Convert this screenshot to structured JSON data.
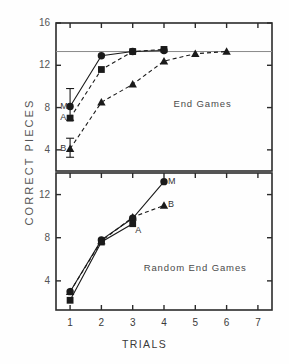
{
  "figure": {
    "axis_y_title": "CORRECT PIECES",
    "axis_x_title": "TRIALS"
  },
  "panels": {
    "top": {
      "note": "End Games",
      "ytick_labels": [
        "16",
        "12",
        "8",
        "4"
      ],
      "series_labels": {
        "m": "M",
        "a": "A",
        "b": "B"
      }
    },
    "bottom": {
      "note": "Random End Games",
      "ytick_labels": [
        "12",
        "8",
        "4"
      ],
      "series_labels": {
        "m": "M",
        "a": "A",
        "b": "B"
      }
    }
  },
  "xtick_labels": [
    "1",
    "2",
    "3",
    "4",
    "5",
    "6",
    "7"
  ],
  "colors": {
    "ink": "#1a1a1a",
    "axis": "#2b2b2b",
    "text": "#3a3a3a",
    "reference_line": "#8a8a8a",
    "background": "#fefefe"
  },
  "chart_data": {
    "type": "line",
    "title": "",
    "xlabel": "TRIALS",
    "ylabel": "CORRECT PIECES",
    "panels": [
      {
        "name": "End Games",
        "ylim": [
          2.0,
          16.0
        ],
        "yticks": [
          16,
          12,
          8,
          4
        ],
        "xlim": [
          0.55,
          7.45
        ],
        "xticks": [
          1,
          2,
          3,
          4,
          5,
          6,
          7
        ],
        "grid": false,
        "reference_line": {
          "y": 13.3,
          "style": "solid",
          "color": "#8a8a8a"
        },
        "series": [
          {
            "name": "M",
            "marker": "circle",
            "line": "solid",
            "x": [
              1,
              2,
              3,
              4
            ],
            "values": [
              8.1,
              12.9,
              13.3,
              13.4
            ],
            "error_bars": [
              {
                "x": 1,
                "low": 6.8,
                "high": 9.8
              }
            ]
          },
          {
            "name": "A",
            "marker": "square",
            "line": "dashed",
            "x": [
              1,
              2,
              3,
              4
            ],
            "values": [
              7.0,
              11.6,
              13.3,
              13.5
            ],
            "error_bars": []
          },
          {
            "name": "B",
            "marker": "triangle",
            "line": "dashed",
            "x": [
              1,
              2,
              3,
              4,
              5,
              6
            ],
            "values": [
              4.1,
              8.5,
              10.2,
              12.4,
              13.1,
              13.3
            ],
            "error_bars": [
              {
                "x": 1,
                "low": 3.3,
                "high": 5.1
              }
            ]
          }
        ],
        "annotations": [
          {
            "text": "End Games",
            "x": 4.3,
            "y": 8.3
          },
          {
            "text": "M",
            "x": 0.78,
            "y": 8.1
          },
          {
            "text": "A",
            "x": 0.78,
            "y": 7.0
          },
          {
            "text": "B",
            "x": 0.78,
            "y": 4.1
          }
        ]
      },
      {
        "name": "Random End Games",
        "ylim": [
          1.3,
          14.0
        ],
        "yticks": [
          12,
          8,
          4
        ],
        "xlim": [
          0.55,
          7.45
        ],
        "xticks": [
          1,
          2,
          3,
          4,
          5,
          6,
          7
        ],
        "grid": false,
        "series": [
          {
            "name": "M",
            "marker": "circle",
            "line": "solid",
            "x": [
              1,
              2,
              3,
              4
            ],
            "values": [
              3.0,
              7.8,
              9.8,
              13.2
            ],
            "error_bars": []
          },
          {
            "name": "A",
            "marker": "square",
            "line": "solid",
            "x": [
              1,
              2,
              3
            ],
            "values": [
              2.2,
              7.6,
              9.3
            ],
            "error_bars": []
          },
          {
            "name": "B",
            "marker": "triangle",
            "line": "dashed",
            "x": [
              1,
              2,
              3,
              4
            ],
            "values": [
              3.0,
              7.7,
              9.9,
              11.0
            ],
            "error_bars": []
          }
        ],
        "annotations": [
          {
            "text": "Random End Games",
            "x": 3.35,
            "y": 5.2
          },
          {
            "text": "M",
            "x": 4.22,
            "y": 13.2
          },
          {
            "text": "B",
            "x": 4.22,
            "y": 11.0
          },
          {
            "text": "A",
            "x": 3.18,
            "y": 8.6
          }
        ]
      }
    ]
  }
}
